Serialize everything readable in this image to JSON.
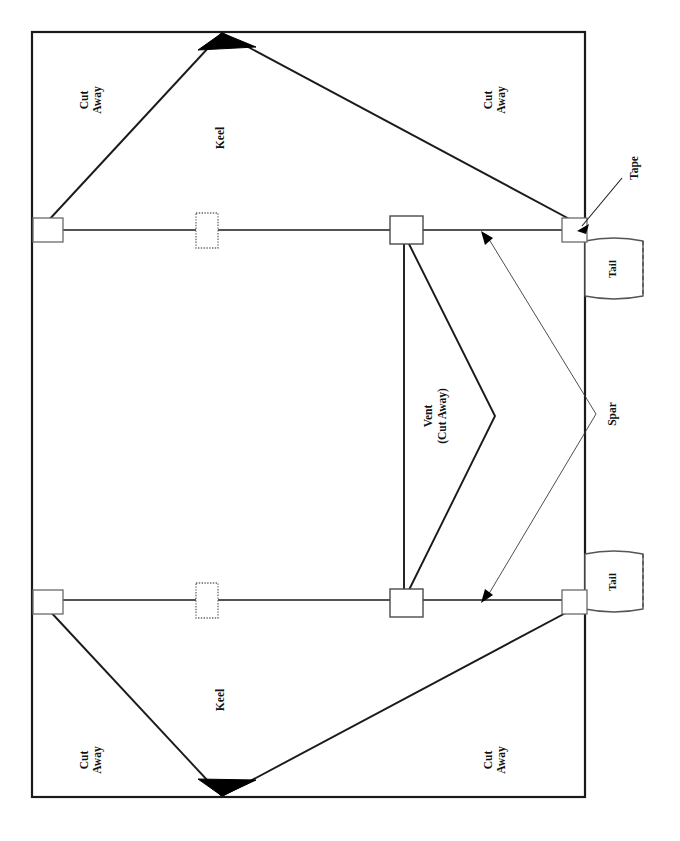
{
  "diagram": {
    "background_color": "#ffffff",
    "line_color": "#1a1a1a",
    "fill_color": "#000000",
    "panel": {
      "name": "sail-panel",
      "x": 32,
      "y": 32,
      "width": 553,
      "height": 765
    },
    "labels": {
      "cut_away_top_left": "Cut\nAway",
      "cut_away_top_right": "Cut\nAway",
      "cut_away_bottom_left": "Cut\nAway",
      "cut_away_bottom_right": "Cut\nAway",
      "keel_top": "Keel",
      "keel_bottom": "Keel",
      "vent": "Vent\n(Cut Away)",
      "vent_line1": "Vent",
      "vent_line2": "(Cut Away)",
      "spar": "Spar",
      "tape": "Tape",
      "tail_top": "Tail",
      "tail_bottom": "Tail",
      "cut": "Cut",
      "away": "Away"
    },
    "spars": [
      {
        "name": "upper-spar",
        "x1": 32,
        "y1": 230,
        "x2": 585,
        "y2": 230
      },
      {
        "name": "lower-spar",
        "x1": 32,
        "y1": 600,
        "x2": 585,
        "y2": 600
      }
    ],
    "tape_markers": [
      {
        "name": "tape-top-left",
        "x": 33,
        "y": 218,
        "width": 30,
        "height": 24,
        "style": "solid"
      },
      {
        "name": "tape-top-mid",
        "x": 196,
        "y": 213,
        "width": 22,
        "height": 35,
        "style": "dotted"
      },
      {
        "name": "tape-top-vent",
        "x": 390,
        "y": 216,
        "width": 33,
        "height": 28,
        "style": "solid"
      },
      {
        "name": "tape-top-right",
        "x": 562,
        "y": 218,
        "width": 25,
        "height": 24,
        "style": "solid"
      },
      {
        "name": "tape-bottom-left",
        "x": 33,
        "y": 590,
        "width": 30,
        "height": 24,
        "style": "solid"
      },
      {
        "name": "tape-bottom-mid",
        "x": 196,
        "y": 583,
        "width": 22,
        "height": 35,
        "style": "dotted"
      },
      {
        "name": "tape-bottom-vent",
        "x": 390,
        "y": 589,
        "width": 33,
        "height": 28,
        "style": "solid"
      },
      {
        "name": "tape-bottom-right",
        "x": 562,
        "y": 590,
        "width": 25,
        "height": 24,
        "style": "solid"
      }
    ],
    "tails": [
      {
        "name": "tail-top",
        "x": 585,
        "y": 240,
        "width": 58,
        "height": 57
      },
      {
        "name": "tail-bottom",
        "x": 585,
        "y": 553,
        "width": 58,
        "height": 57
      }
    ],
    "keels": [
      {
        "name": "keel-top",
        "apex_x": 222,
        "apex_y": 33,
        "left_x": 47,
        "left_y": 222,
        "right_x": 575,
        "right_y": 222
      },
      {
        "name": "keel-bottom",
        "apex_x": 222,
        "apex_y": 796,
        "left_x": 47,
        "left_y": 608,
        "right_x": 575,
        "right_y": 608
      }
    ],
    "solid_triangles": [
      {
        "name": "keel-tip-top",
        "points": "198,50 222,33 256,47"
      },
      {
        "name": "keel-tip-bottom",
        "points": "198,779 222,796 256,780"
      }
    ],
    "vent": {
      "name": "vent-cut-away",
      "vertical_line": {
        "x": 404,
        "y1": 232,
        "y2": 598
      },
      "chevron_points": "406,238 495,416 406,596",
      "apex_x": 495,
      "apex_y": 416
    },
    "leaders": [
      {
        "name": "tape-leader",
        "path": "M 620,180 L 578,227",
        "arrow_at": "578,227"
      },
      {
        "name": "spar-leader-up",
        "path": "M 595,414 L 484,234",
        "arrow_at": "484,234"
      },
      {
        "name": "spar-leader-down",
        "path": "M 595,414 L 484,600",
        "arrow_at": "484,600"
      }
    ]
  }
}
